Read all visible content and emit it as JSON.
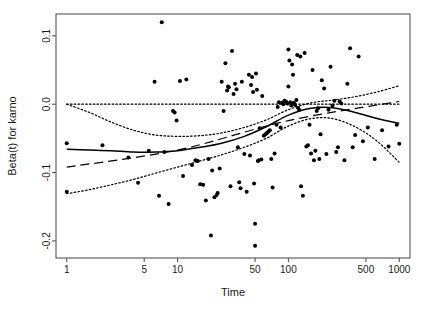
{
  "chart_data": {
    "type": "scatter",
    "title": "",
    "xlabel": "Time",
    "ylabel": "Beta(t) for karno",
    "x_scale": "log",
    "xlim": [
      0.8,
      1250
    ],
    "ylim": [
      -0.225,
      0.132
    ],
    "grid": false,
    "legend": false,
    "x_ticks": [
      1,
      5,
      10,
      50,
      100,
      500,
      1000
    ],
    "x_tick_labels": [
      "1",
      "5",
      "10",
      "50",
      "100",
      "500",
      "1000"
    ],
    "y_ticks": [
      0.1,
      0.0,
      -0.1,
      -0.2
    ],
    "y_tick_labels": [
      "0.1",
      "0.0",
      "-0.1",
      "-0.2"
    ],
    "series": [
      {
        "name": "Schoenfeld residuals",
        "type": "scatter",
        "marker": "filled-circle",
        "color": "#000000",
        "points": [
          [
            1.0,
            -0.057
          ],
          [
            1.0,
            -0.128
          ],
          [
            2.1,
            -0.06
          ],
          [
            3.6,
            -0.078
          ],
          [
            4.4,
            -0.115
          ],
          [
            5.5,
            -0.068
          ],
          [
            6.2,
            0.033
          ],
          [
            6.8,
            -0.134
          ],
          [
            7.2,
            0.12
          ],
          [
            7.6,
            -0.07
          ],
          [
            8.3,
            -0.146
          ],
          [
            9.1,
            -0.01
          ],
          [
            9.4,
            -0.012
          ],
          [
            9.8,
            -0.024
          ],
          [
            10.5,
            0.034
          ],
          [
            11.2,
            -0.105
          ],
          [
            12.0,
            0.036
          ],
          [
            13.5,
            -0.089
          ],
          [
            14.5,
            -0.082
          ],
          [
            15.2,
            -0.083
          ],
          [
            16.0,
            -0.117
          ],
          [
            17.0,
            -0.118
          ],
          [
            18.0,
            -0.141
          ],
          [
            19.0,
            -0.08
          ],
          [
            20.0,
            -0.192
          ],
          [
            20.5,
            -0.097
          ],
          [
            21.5,
            -0.136
          ],
          [
            22.5,
            -0.133
          ],
          [
            23.0,
            -0.13
          ],
          [
            24.0,
            -0.094
          ],
          [
            25.0,
            0.033
          ],
          [
            26.0,
            -0.01
          ],
          [
            27.0,
            0.06
          ],
          [
            28.0,
            0.02
          ],
          [
            28.5,
            0.026
          ],
          [
            29.0,
            0.025
          ],
          [
            30.0,
            -0.12
          ],
          [
            31.0,
            0.078
          ],
          [
            32.0,
            0.015
          ],
          [
            33.0,
            0.03
          ],
          [
            34.0,
            0.022
          ],
          [
            35.0,
            -0.063
          ],
          [
            36.0,
            -0.114
          ],
          [
            37.0,
            -0.123
          ],
          [
            38.0,
            0.033
          ],
          [
            40.0,
            -0.073
          ],
          [
            42.0,
            -0.128
          ],
          [
            44.0,
            0.043
          ],
          [
            45.0,
            -0.075
          ],
          [
            46.0,
            0.028
          ],
          [
            47.0,
            0.04
          ],
          [
            48.0,
            0.018
          ],
          [
            49.0,
            -0.116
          ],
          [
            50.0,
            -0.175
          ],
          [
            50.0,
            -0.207
          ],
          [
            51.0,
            0.045
          ],
          [
            52.0,
            0.021
          ],
          [
            53.0,
            -0.083
          ],
          [
            54.0,
            -0.082
          ],
          [
            55.0,
            -0.035
          ],
          [
            57.0,
            -0.081
          ],
          [
            58.0,
            0.012
          ],
          [
            60.0,
            -0.046
          ],
          [
            62.0,
            -0.044
          ],
          [
            64.0,
            -0.042
          ],
          [
            66.0,
            -0.04
          ],
          [
            68.0,
            -0.038
          ],
          [
            70.0,
            -0.08
          ],
          [
            72.0,
            -0.122
          ],
          [
            75.0,
            -0.072
          ],
          [
            78.0,
            -0.03
          ],
          [
            80.0,
            -0.004
          ],
          [
            82.0,
            0.003
          ],
          [
            85.0,
            -0.034
          ],
          [
            88.0,
            0.002
          ],
          [
            90.0,
            0.0
          ],
          [
            92.0,
            0.005
          ],
          [
            95.0,
            0.004
          ],
          [
            98.0,
            0.001
          ],
          [
            100.0,
            0.08
          ],
          [
            100.0,
            0.026
          ],
          [
            102.0,
            0.064
          ],
          [
            104.0,
            0.003
          ],
          [
            106.0,
            -0.002
          ],
          [
            108.0,
            0.058
          ],
          [
            110.0,
            0.043
          ],
          [
            112.0,
            0.002
          ],
          [
            115.0,
            -0.001
          ],
          [
            118.0,
            0.006
          ],
          [
            120.0,
            0.072
          ],
          [
            122.0,
            -0.005
          ],
          [
            125.0,
            -0.008
          ],
          [
            128.0,
            0.07
          ],
          [
            130.0,
            -0.12
          ],
          [
            135.0,
            -0.134
          ],
          [
            140.0,
            0.075
          ],
          [
            145.0,
            -0.062
          ],
          [
            150.0,
            -0.06
          ],
          [
            155.0,
            -0.03
          ],
          [
            160.0,
            -0.072
          ],
          [
            165.0,
            0.05
          ],
          [
            170.0,
            -0.082
          ],
          [
            175.0,
            -0.068
          ],
          [
            180.0,
            -0.01
          ],
          [
            185.0,
            -0.006
          ],
          [
            190.0,
            -0.08
          ],
          [
            195.0,
            -0.044
          ],
          [
            200.0,
            0.035
          ],
          [
            210.0,
            0.023
          ],
          [
            220.0,
            -0.073
          ],
          [
            230.0,
            -0.008
          ],
          [
            240.0,
            0.055
          ],
          [
            250.0,
            -0.002
          ],
          [
            260.0,
            0.005
          ],
          [
            270.0,
            -0.07
          ],
          [
            280.0,
            -0.063
          ],
          [
            290.0,
            0.004
          ],
          [
            300.0,
            0.001
          ],
          [
            320.0,
            -0.082
          ],
          [
            340.0,
            0.03
          ],
          [
            360.0,
            0.082
          ],
          [
            380.0,
            -0.063
          ],
          [
            400.0,
            -0.045
          ],
          [
            430.0,
            0.07
          ],
          [
            470.0,
            -0.054
          ],
          [
            520.0,
            -0.034
          ],
          [
            600.0,
            -0.08
          ],
          [
            700.0,
            -0.038
          ],
          [
            800.0,
            -0.062
          ],
          [
            950.0,
            -0.03
          ],
          [
            1000.0,
            -0.058
          ]
        ]
      },
      {
        "name": "Smoothed Beta(t)",
        "type": "line",
        "style": "solid",
        "color": "#000000",
        "points": [
          [
            1.0,
            -0.066
          ],
          [
            1.6,
            -0.067
          ],
          [
            2.5,
            -0.068
          ],
          [
            4.0,
            -0.07
          ],
          [
            6.3,
            -0.07
          ],
          [
            10.0,
            -0.068
          ],
          [
            16.0,
            -0.063
          ],
          [
            25.0,
            -0.057
          ],
          [
            40.0,
            -0.047
          ],
          [
            63.0,
            -0.033
          ],
          [
            100.0,
            -0.016
          ],
          [
            160.0,
            -0.006
          ],
          [
            250.0,
            -0.005
          ],
          [
            400.0,
            -0.012
          ],
          [
            630.0,
            -0.021
          ],
          [
            1000.0,
            -0.028
          ]
        ]
      },
      {
        "name": "Linear fit",
        "type": "line",
        "style": "dashed",
        "color": "#000000",
        "points": [
          [
            1.0,
            -0.092
          ],
          [
            10.0,
            -0.067
          ],
          [
            100.0,
            -0.024
          ],
          [
            1000.0,
            0.004
          ]
        ]
      },
      {
        "name": "Upper confidence band",
        "type": "line",
        "style": "dotted",
        "color": "#000000",
        "points": [
          [
            1.0,
            0.0
          ],
          [
            1.6,
            -0.012
          ],
          [
            2.5,
            -0.026
          ],
          [
            4.0,
            -0.038
          ],
          [
            6.3,
            -0.045
          ],
          [
            10.0,
            -0.047
          ],
          [
            16.0,
            -0.046
          ],
          [
            25.0,
            -0.042
          ],
          [
            40.0,
            -0.034
          ],
          [
            63.0,
            -0.023
          ],
          [
            100.0,
            -0.008
          ],
          [
            160.0,
            0.002
          ],
          [
            250.0,
            0.006
          ],
          [
            400.0,
            0.011
          ],
          [
            630.0,
            0.018
          ],
          [
            1000.0,
            0.027
          ]
        ]
      },
      {
        "name": "Lower confidence band",
        "type": "line",
        "style": "dotted",
        "color": "#000000",
        "points": [
          [
            1.0,
            -0.131
          ],
          [
            1.6,
            -0.125
          ],
          [
            2.5,
            -0.118
          ],
          [
            4.0,
            -0.11
          ],
          [
            6.3,
            -0.101
          ],
          [
            10.0,
            -0.092
          ],
          [
            16.0,
            -0.083
          ],
          [
            25.0,
            -0.074
          ],
          [
            40.0,
            -0.063
          ],
          [
            63.0,
            -0.05
          ],
          [
            100.0,
            -0.032
          ],
          [
            160.0,
            -0.021
          ],
          [
            250.0,
            -0.021
          ],
          [
            400.0,
            -0.033
          ],
          [
            630.0,
            -0.054
          ],
          [
            1000.0,
            -0.085
          ]
        ]
      },
      {
        "name": "Zero reference line",
        "type": "line",
        "style": "dotted",
        "color": "#000000",
        "points": [
          [
            1.0,
            0.0
          ],
          [
            1000.0,
            0.0
          ]
        ]
      }
    ]
  }
}
